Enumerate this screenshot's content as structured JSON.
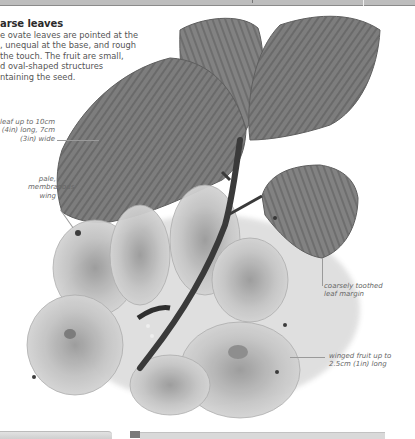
{
  "page": {
    "section": {
      "heading": "arse leaves",
      "body_lines": [
        "e ovate leaves are pointed at the",
        ", unequal at the base, and rough",
        " the touch. The fruit are small,",
        "d oval-shaped structures",
        "ntaining the seed."
      ]
    },
    "annotations": {
      "leaf_size": [
        "leaf up to 10cm",
        "(4in) long, 7cm",
        "(3in) wide"
      ],
      "wing": [
        "pale,",
        "membranous",
        "wing"
      ],
      "margin": [
        "coarsely toothed",
        "leaf margin"
      ],
      "fruit": [
        "winged fruit up to",
        "2.5cm (1in) long"
      ]
    },
    "illustration": {
      "subject": "leaf-and-winged-fruit-photo",
      "tone": "grayscale"
    }
  }
}
